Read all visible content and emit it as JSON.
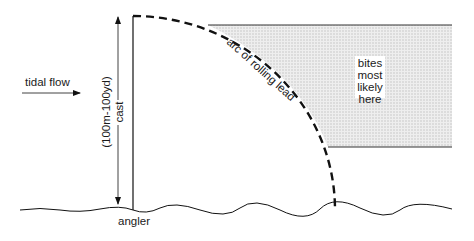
{
  "labels": {
    "tidal_flow": "tidal flow",
    "cast_line1": "(100m-100yd)",
    "cast_line2": "cast",
    "arc": "arc of rolling lead",
    "bites": [
      "bites",
      "most",
      "likely",
      "here"
    ],
    "angler": "angler"
  },
  "colors": {
    "line": "#111111",
    "shade": "#e6e6e6",
    "shade_dot": "#bdbdbd"
  }
}
